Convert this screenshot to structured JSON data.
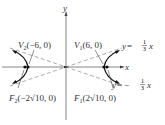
{
  "diagram": {
    "type": "hyperbola",
    "axes": {
      "x_label": "x",
      "y_label": "y"
    },
    "vertices": [
      {
        "name": "V",
        "index": "1",
        "coords": "(6, 0)"
      },
      {
        "name": "V",
        "index": "2",
        "coords": "(−6, 0)"
      }
    ],
    "foci": [
      {
        "name": "F",
        "index": "1",
        "coords": "(2√10, 0)"
      },
      {
        "name": "F",
        "index": "2",
        "coords": "(−2√10, 0)"
      }
    ],
    "asymptotes": [
      {
        "lhs": "y = ",
        "sign": "",
        "frac_num": "1",
        "frac_den": "3",
        "var": "x"
      },
      {
        "lhs": "y = ",
        "sign": "−",
        "frac_num": "1",
        "frac_den": "3",
        "var": "x"
      }
    ],
    "colors": {
      "curve": "#111111",
      "axis": "#555555",
      "dash": "#888888",
      "text": "#333333"
    }
  }
}
